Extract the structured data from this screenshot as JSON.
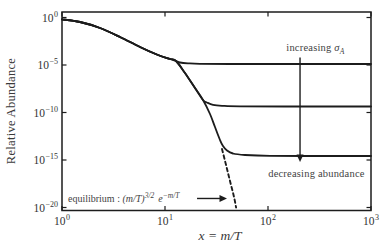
{
  "figure": {
    "width": 391,
    "height": 251
  },
  "colors": {
    "background": "#ffffff",
    "curve": "#1c1c1c",
    "frame": "#1c1c1c",
    "tick_text": "#333333",
    "annotation_text": "#3f3f3f"
  },
  "chart_data": {
    "type": "line",
    "title": "",
    "xlabel": "x = m/T",
    "ylabel": "Relative Abundance",
    "x_scale": "log",
    "y_scale": "log",
    "x_range_log10": [
      0,
      3
    ],
    "y_range_log10": [
      -20,
      0
    ],
    "grid": false,
    "legend": "none",
    "x_ticks": [
      {
        "label": "10^0",
        "log": 0
      },
      {
        "label": "10^1",
        "log": 1
      },
      {
        "label": "10^2",
        "log": 2
      },
      {
        "label": "10^3",
        "log": 3
      }
    ],
    "y_ticks": [
      {
        "label": "10^0",
        "log": 0
      },
      {
        "label": "10^−5",
        "log": -5
      },
      {
        "label": "10^−10",
        "log": -10
      },
      {
        "label": "10^−15",
        "log": -15
      },
      {
        "label": "10^−20",
        "log": -20
      }
    ],
    "series": [
      {
        "name": "freezeout-smallest-sigma",
        "style": "solid",
        "points_log10": [
          [
            0.0,
            -0.2
          ],
          [
            0.175,
            -0.47
          ],
          [
            0.369,
            -1.11
          ],
          [
            0.563,
            -2.05
          ],
          [
            0.757,
            -3.11
          ],
          [
            0.932,
            -3.95
          ],
          [
            1.049,
            -4.37
          ],
          [
            1.107,
            -4.58
          ],
          [
            1.146,
            -4.74
          ],
          [
            1.223,
            -4.82
          ],
          [
            1.34,
            -4.87
          ],
          [
            1.631,
            -4.89
          ],
          [
            2.311,
            -4.89
          ],
          [
            3.0,
            -4.89
          ]
        ]
      },
      {
        "name": "freezeout-medium-sigma",
        "style": "solid",
        "points_log10": [
          [
            0.0,
            -0.2
          ],
          [
            0.175,
            -0.47
          ],
          [
            0.369,
            -1.11
          ],
          [
            0.563,
            -2.05
          ],
          [
            0.757,
            -3.11
          ],
          [
            0.932,
            -3.95
          ],
          [
            1.049,
            -4.37
          ],
          [
            1.107,
            -4.58
          ],
          [
            1.194,
            -5.84
          ],
          [
            1.291,
            -7.42
          ],
          [
            1.369,
            -8.68
          ],
          [
            1.408,
            -8.95
          ],
          [
            1.466,
            -9.19
          ],
          [
            1.553,
            -9.29
          ],
          [
            1.728,
            -9.35
          ],
          [
            2.311,
            -9.37
          ],
          [
            3.0,
            -9.37
          ]
        ]
      },
      {
        "name": "freezeout-largest-sigma",
        "style": "solid",
        "points_log10": [
          [
            0.0,
            -0.2
          ],
          [
            0.175,
            -0.47
          ],
          [
            0.369,
            -1.11
          ],
          [
            0.563,
            -2.05
          ],
          [
            0.757,
            -3.11
          ],
          [
            0.932,
            -3.95
          ],
          [
            1.049,
            -4.37
          ],
          [
            1.107,
            -4.58
          ],
          [
            1.194,
            -5.84
          ],
          [
            1.291,
            -7.42
          ],
          [
            1.369,
            -8.68
          ],
          [
            1.437,
            -10.16
          ],
          [
            1.485,
            -11.53
          ],
          [
            1.534,
            -12.89
          ],
          [
            1.563,
            -13.53
          ],
          [
            1.602,
            -14.0
          ],
          [
            1.66,
            -14.32
          ],
          [
            1.777,
            -14.47
          ],
          [
            2.019,
            -14.56
          ],
          [
            2.505,
            -14.58
          ],
          [
            3.0,
            -14.58
          ]
        ]
      },
      {
        "name": "equilibrium-continuation",
        "style": "dashed",
        "points_log10": [
          [
            1.553,
            -13.84
          ],
          [
            1.583,
            -15.1
          ],
          [
            1.612,
            -16.37
          ],
          [
            1.641,
            -17.63
          ],
          [
            1.67,
            -18.89
          ],
          [
            1.69,
            -20.0
          ]
        ]
      }
    ],
    "annotations": {
      "increasing": {
        "text": "increasing ",
        "symbol": "σ",
        "symbol_sub": "A",
        "x": 2.46,
        "y": -3.1
      },
      "arrow_down": {
        "x": 2.311,
        "y1": -4.2,
        "y2": -15.2
      },
      "decreasing": {
        "text": "decreasing abundance",
        "x": 2.47,
        "y": -16.4
      },
      "equilibrium": {
        "prefix": "equilibrium : ",
        "base1": "(m/T)",
        "exp1": "3/2",
        "base2": "e",
        "exp2": "−m/T",
        "x": 0.058,
        "y": -19.0
      },
      "arrow_right": {
        "x1": 1.311,
        "x2": 1.602,
        "y": -19.05
      }
    }
  }
}
